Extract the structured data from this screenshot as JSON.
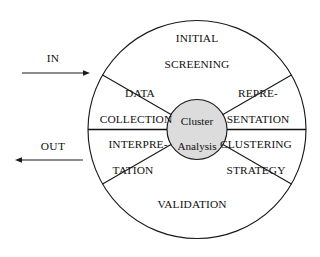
{
  "diagram": {
    "hub": {
      "line1": "Cluster",
      "line2": "Analysis",
      "fill": "#dcdcdc",
      "stroke": "#1a1a1a"
    },
    "flows": [
      {
        "label": "IN",
        "direction": "right"
      },
      {
        "label": "OUT",
        "direction": "left"
      }
    ],
    "sectors": [
      {
        "id": "initial-screening",
        "line1": "INITIAL",
        "line2": "SCREENING",
        "position": "top"
      },
      {
        "id": "representation",
        "line1": "REPRE-",
        "line2": "SENTATION",
        "position": "upper-right"
      },
      {
        "id": "clustering-strategy",
        "line1": "CLUSTERING",
        "line2": "STRATEGY",
        "position": "lower-right"
      },
      {
        "id": "validation",
        "line1": "VALIDATION",
        "line2": "",
        "position": "bottom"
      },
      {
        "id": "interpretation",
        "line1": "INTERPRE-",
        "line2": "TATION",
        "position": "lower-left"
      },
      {
        "id": "data-collection",
        "line1": "DATA",
        "line2": "COLLECTION",
        "position": "upper-left"
      }
    ],
    "colors": {
      "stroke": "#1a1a1a",
      "background": "#ffffff",
      "hub_fill": "#dcdcdc",
      "text": "#111111"
    }
  }
}
